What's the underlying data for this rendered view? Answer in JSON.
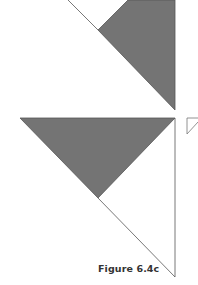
{
  "figure": {
    "caption": "Figure 6.4c",
    "colors": {
      "shade_fill": "#747474",
      "line": "#555555",
      "background": "#ffffff"
    },
    "shapes": [
      {
        "name": "upper-shaded-triangle",
        "points": "128,0 175,0 175,110 98,30"
      },
      {
        "name": "lower-shaded-triangle",
        "points": "20,118 175,118 98,198"
      },
      {
        "name": "upper-diagonal-line",
        "points": "68,0 98,30"
      },
      {
        "name": "lower-diagonal-line",
        "points": "98,198 175,277"
      },
      {
        "name": "right-vertical-line",
        "points": "175,118 175,277"
      },
      {
        "name": "small-corner-triangle",
        "points": "187,118 198,118 187,134"
      }
    ]
  }
}
